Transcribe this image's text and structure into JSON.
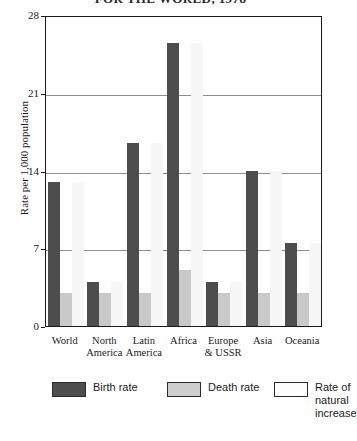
{
  "chart_data": {
    "type": "bar",
    "title": "FOR THE WORLD, 1978",
    "xlabel": "",
    "ylabel": "Rate per 1,000 population",
    "ylim": [
      0,
      28
    ],
    "yticks": [
      0,
      7,
      14,
      21,
      28
    ],
    "ytick_labels": [
      "0",
      "7",
      "14",
      "21",
      "28"
    ],
    "grid": true,
    "legend_position": "bottom",
    "categories": [
      "World",
      "North America",
      "Latin America",
      "Africa",
      "Europe & USSR",
      "Asia",
      "Oceania"
    ],
    "category_lines": [
      [
        "World"
      ],
      [
        "North",
        "America"
      ],
      [
        "Latin",
        "America"
      ],
      [
        "Africa"
      ],
      [
        "Europe",
        "& USSR"
      ],
      [
        "Asia"
      ],
      [
        "Oceania"
      ]
    ],
    "series": [
      {
        "name": "Birth rate",
        "key": "birth",
        "color": "#4d4d4d",
        "values": [
          13,
          4,
          16.5,
          25.5,
          4,
          14,
          7.5
        ]
      },
      {
        "name": "Death rate",
        "key": "death",
        "color": "#c9c9c9",
        "values": [
          3,
          3,
          3,
          5,
          3,
          3,
          3
        ]
      },
      {
        "name": "Rate of natural increase",
        "key": "increase",
        "color": "#f7f7f7",
        "values": [
          13,
          4,
          16.5,
          25.5,
          4,
          14,
          7.5
        ]
      }
    ],
    "legend": [
      {
        "label": "Birth rate",
        "key": "birth"
      },
      {
        "label": "Death rate",
        "key": "death"
      },
      {
        "label": "Rate of\nnatural\nincrease",
        "key": "increase"
      }
    ]
  }
}
